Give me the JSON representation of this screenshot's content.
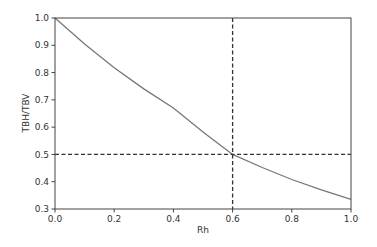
{
  "chart_data": {
    "type": "line",
    "title": "",
    "xlabel": "Rh",
    "ylabel": "TBH/TBV",
    "xlim": [
      0.0,
      1.0
    ],
    "ylim": [
      0.3,
      1.0
    ],
    "xticks": [
      "0.0",
      "0.2",
      "0.4",
      "0.6",
      "0.8",
      "1.0"
    ],
    "yticks": [
      "0.3",
      "0.4",
      "0.5",
      "0.6",
      "0.7",
      "0.8",
      "0.9",
      "1.0"
    ],
    "grid": false,
    "legend": null,
    "series": [
      {
        "name": "TBH/TBV",
        "color": "#777777",
        "x": [
          0.0,
          0.1,
          0.2,
          0.3,
          0.4,
          0.5,
          0.6,
          0.7,
          0.8,
          0.9,
          1.0
        ],
        "y": [
          1.0,
          0.905,
          0.818,
          0.74,
          0.67,
          0.582,
          0.5,
          0.452,
          0.408,
          0.37,
          0.335
        ]
      }
    ],
    "reference_lines": [
      {
        "orientation": "vertical",
        "value": 0.6,
        "style": "dashed",
        "color": "#333333"
      },
      {
        "orientation": "horizontal",
        "value": 0.5,
        "style": "dashed",
        "color": "#333333"
      }
    ]
  }
}
